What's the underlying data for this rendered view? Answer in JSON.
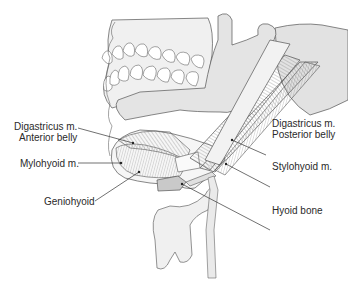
{
  "figure": {
    "colors": {
      "bone_fill": "#e6e6e6",
      "skull_fill": "#ececec",
      "outline": "#555555",
      "muscle_fill": "#f4f4f4",
      "muscle_dark": "#b8b8b8",
      "hyoid_fill": "#c9c9c9",
      "larynx_fill": "#f2f2f2",
      "leader_line": "#333333",
      "text": "#2a2a2a"
    }
  },
  "labels": {
    "digastric_anterior": {
      "line1": "Digastricus m.",
      "line2": "Anterior belly"
    },
    "mylohyoid": {
      "text": "Mylohyoid m."
    },
    "geniohyoid": {
      "text": "Geniohyoid"
    },
    "digastric_posterior": {
      "line1": "Digastricus m.",
      "line2": "Posterior belly"
    },
    "stylohyoid": {
      "text": "Stylohyoid m."
    },
    "hyoid_bone": {
      "text": "Hyoid bone"
    }
  }
}
